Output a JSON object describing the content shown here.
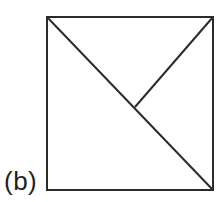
{
  "figure": {
    "label": "(b)",
    "canvas": {
      "width": 221,
      "height": 202
    },
    "background": "#ffffff",
    "stroke_color": "#2b2b2b",
    "stroke_width": 2,
    "shapes": [
      {
        "type": "rect",
        "name": "square-outline",
        "x": 47,
        "y": 17,
        "width": 166,
        "height": 173
      },
      {
        "type": "line",
        "name": "diagonal-topleft-to-bottomright",
        "x1": 47,
        "y1": 17,
        "x2": 213,
        "y2": 190
      },
      {
        "type": "line",
        "name": "segment-topright-to-center",
        "x1": 213,
        "y1": 17,
        "x2": 135,
        "y2": 107
      }
    ]
  }
}
